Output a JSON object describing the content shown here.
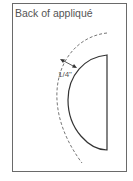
{
  "diagram": {
    "title": "Back of appliqué",
    "seam_allowance_label": "1/4\"",
    "colors": {
      "frame": "#6a6a6a",
      "shape_outline": "#333333",
      "cut_line": "#777777",
      "text": "#555555"
    }
  }
}
